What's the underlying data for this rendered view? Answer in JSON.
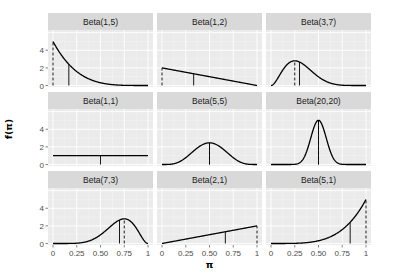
{
  "chart_data": {
    "type": "line",
    "layout": "facet_wrap 3x3",
    "xlabel": "π",
    "ylabel": "f(π)",
    "xlim": [
      0,
      1
    ],
    "ylim": [
      0,
      6.3
    ],
    "x_ticks": [
      "0",
      "0.25",
      "0.50",
      "0.75",
      "1"
    ],
    "y_ticks": [
      "0",
      "2",
      "4"
    ],
    "grid": true,
    "panels": [
      {
        "label": "Beta(1,5)",
        "alpha": 1,
        "beta": 5,
        "mean": 0.1667,
        "mode": 0
      },
      {
        "label": "Beta(1,2)",
        "alpha": 1,
        "beta": 2,
        "mean": 0.3333,
        "mode": 0
      },
      {
        "label": "Beta(3,7)",
        "alpha": 3,
        "beta": 7,
        "mean": 0.3,
        "mode": 0.25
      },
      {
        "label": "Beta(1,1)",
        "alpha": 1,
        "beta": 1,
        "mean": 0.5,
        "mode": null
      },
      {
        "label": "Beta(5,5)",
        "alpha": 5,
        "beta": 5,
        "mean": 0.5,
        "mode": 0.5
      },
      {
        "label": "Beta(20,20)",
        "alpha": 20,
        "beta": 20,
        "mean": 0.5,
        "mode": 0.5
      },
      {
        "label": "Beta(7,3)",
        "alpha": 7,
        "beta": 3,
        "mean": 0.7,
        "mode": 0.75
      },
      {
        "label": "Beta(2,1)",
        "alpha": 2,
        "beta": 1,
        "mean": 0.6667,
        "mode": 1
      },
      {
        "label": "Beta(5,1)",
        "alpha": 5,
        "beta": 1,
        "mean": 0.8333,
        "mode": 1
      }
    ],
    "annotations": "solid vertical line = mean; dashed vertical line = mode"
  },
  "colors": {
    "panel_bg": "#ebebeb",
    "strip_bg": "#d9d9d9",
    "grid_major": "#ffffff",
    "grid_minor": "#f5f5f5",
    "line": "#000000"
  }
}
